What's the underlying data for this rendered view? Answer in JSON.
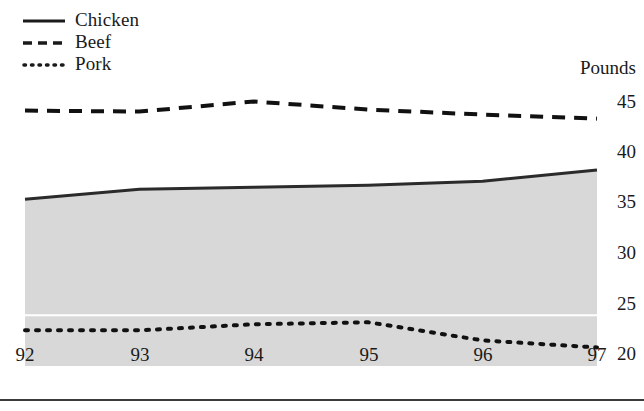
{
  "chart_data": {
    "type": "line",
    "title": "",
    "subtitle": "",
    "xlabel": "",
    "ylabel": "Pounds",
    "units_label": "Pounds",
    "x": [
      92,
      93,
      94,
      95,
      96,
      97
    ],
    "categories": [
      "92",
      "93",
      "94",
      "95",
      "96",
      "97"
    ],
    "xtick_labels": [
      "92",
      "93",
      "94",
      "95",
      "96",
      "97"
    ],
    "ytick_labels": [
      "20",
      "25",
      "30",
      "35",
      "40",
      "45"
    ],
    "yticks": [
      20,
      25,
      30,
      35,
      40,
      45
    ],
    "ylim": [
      19.2,
      46.5
    ],
    "xlim": [
      92,
      97
    ],
    "grid": false,
    "legend_position": "top-left",
    "series": [
      {
        "name": "Chicken",
        "label": "Chicken",
        "style": "solid",
        "filled": true,
        "fill_color": "#d8d8d8",
        "color": "#2b2b2b",
        "values": [
          35.2,
          36.2,
          36.4,
          36.6,
          37.0,
          38.1
        ]
      },
      {
        "name": "Beef",
        "label": "Beef",
        "style": "dashed",
        "filled": false,
        "color": "#111111",
        "values": [
          44.0,
          43.9,
          44.9,
          44.1,
          43.6,
          43.2
        ]
      },
      {
        "name": "Pork",
        "label": "Pork",
        "style": "dotted",
        "filled": false,
        "color": "#111111",
        "values": [
          22.2,
          22.2,
          22.8,
          23.0,
          21.2,
          20.5
        ]
      }
    ],
    "annotations": []
  },
  "legend": {
    "items": [
      {
        "label": "Chicken",
        "style": "solid"
      },
      {
        "label": "Beef",
        "style": "dashed"
      },
      {
        "label": "Pork",
        "style": "dotted"
      }
    ]
  },
  "axes": {
    "units": "Pounds",
    "y_ticks": [
      "45",
      "40",
      "35",
      "30",
      "25",
      "20"
    ],
    "x_ticks": [
      "92",
      "93",
      "94",
      "95",
      "96",
      "97"
    ]
  },
  "colors": {
    "area_fill": "#d8d8d8",
    "line": "#2b2b2b",
    "text": "#1a1a1a",
    "rule": "#3b3b3b"
  }
}
